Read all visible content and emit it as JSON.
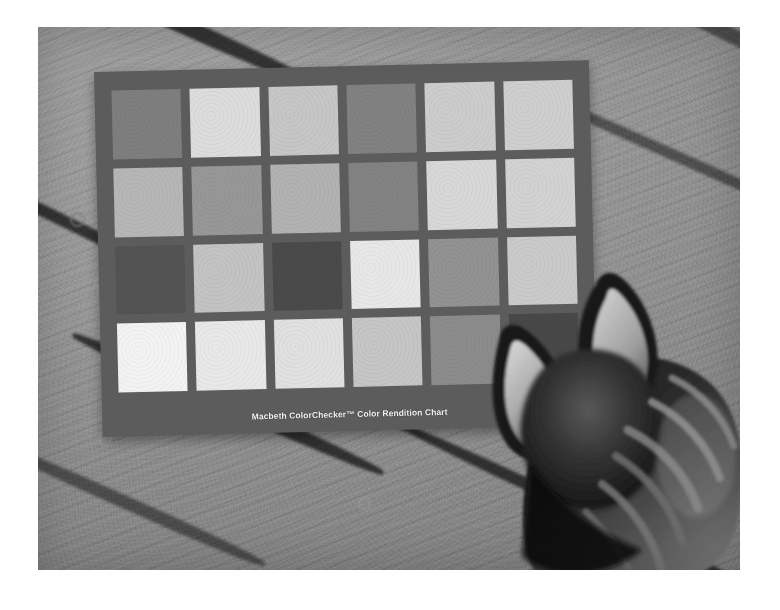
{
  "image": {
    "kind": "photograph",
    "subject": "Macbeth ColorChecker color rendition chart on a wooden deck with a cat",
    "rendering": "grayscale / black-and-white",
    "canvas": {
      "width": 780,
      "height": 610,
      "background": "#ffffff"
    },
    "photo_frame": {
      "left": 38,
      "top": 27,
      "width": 702,
      "height": 543
    }
  },
  "chart": {
    "caption": "Macbeth ColorChecker™ Color Rendition Chart",
    "frame_color": "#5d5d5d",
    "rows": 4,
    "columns": 6,
    "rotation_degrees": -1.35,
    "patches": [
      [
        {
          "name": "dark-skin",
          "gray": "#7e7e7e"
        },
        {
          "name": "light-skin",
          "gray": "#d8d8d8"
        },
        {
          "name": "blue-sky",
          "gray": "#c3c3c3"
        },
        {
          "name": "foliage",
          "gray": "#818181"
        },
        {
          "name": "blue-flower",
          "gray": "#c9c9c9"
        },
        {
          "name": "bluish-green",
          "gray": "#cbcbcb"
        }
      ],
      [
        {
          "name": "orange",
          "gray": "#b4b4b4"
        },
        {
          "name": "purplish-blue",
          "gray": "#969696"
        },
        {
          "name": "moderate-red",
          "gray": "#b0b0b0"
        },
        {
          "name": "purple",
          "gray": "#828282"
        },
        {
          "name": "yellow-green",
          "gray": "#d4d4d4"
        },
        {
          "name": "orange-yellow",
          "gray": "#cfcfcf"
        }
      ],
      [
        {
          "name": "blue",
          "gray": "#555555"
        },
        {
          "name": "green",
          "gray": "#c0c0c0"
        },
        {
          "name": "red",
          "gray": "#4c4c4c"
        },
        {
          "name": "yellow",
          "gray": "#e3e3e3"
        },
        {
          "name": "magenta",
          "gray": "#919191"
        },
        {
          "name": "cyan",
          "gray": "#c6c6c6"
        }
      ],
      [
        {
          "name": "white-9-5",
          "gray": "#eeeeee"
        },
        {
          "name": "neutral-8",
          "gray": "#e4e4e4"
        },
        {
          "name": "neutral-6-5",
          "gray": "#dcdcdc"
        },
        {
          "name": "neutral-5",
          "gray": "#c2c2c2"
        },
        {
          "name": "neutral-3-5",
          "gray": "#8b8b8b"
        },
        {
          "name": "black-2",
          "gray": "#4a4a4a"
        }
      ]
    ]
  },
  "scene": {
    "surface": "weathered wooden deck planks",
    "deck_tone": "#8d8d8d",
    "seam_color": "#1d1d1d",
    "seams": [
      {
        "left": -40,
        "top": -18,
        "width": 330,
        "height": 16,
        "rotate": 24
      },
      {
        "left": 430,
        "top": -30,
        "width": 400,
        "height": 15,
        "rotate": 26
      },
      {
        "left": -70,
        "top": 190,
        "width": 200,
        "height": 12,
        "rotate": 26
      },
      {
        "left": 480,
        "top": 120,
        "width": 300,
        "height": 11,
        "rotate": 24
      },
      {
        "left": 20,
        "top": 370,
        "width": 340,
        "height": 14,
        "rotate": 24
      },
      {
        "left": -60,
        "top": 470,
        "width": 300,
        "height": 13,
        "rotate": 24
      },
      {
        "left": 330,
        "top": 475,
        "width": 420,
        "height": 12,
        "rotate": 25
      }
    ],
    "knots": [
      {
        "left": 32,
        "top": 185,
        "size": 11,
        "tone": "#7a7a7a"
      },
      {
        "left": 56,
        "top": 250,
        "size": 9,
        "tone": "#a5a5a5"
      },
      {
        "left": 86,
        "top": 316,
        "size": 13,
        "tone": "#9c9c9c"
      },
      {
        "left": 130,
        "top": 420,
        "size": 17,
        "tone": "#8a8a8a"
      },
      {
        "left": 60,
        "top": 405,
        "size": 10,
        "tone": "#a0a0a0"
      },
      {
        "left": 320,
        "top": 470,
        "size": 9,
        "tone": "#989898"
      }
    ]
  },
  "cat": {
    "description": "tabby cat head seen from above-behind, facing the chart",
    "fur_dark": "#171717",
    "fur_mid": "#3c3c3c",
    "fur_light": "#b6b6b6",
    "ear_inner": "#cfcfcf",
    "parts": [
      "left-ear",
      "right-ear",
      "head",
      "neck",
      "back-stripes"
    ]
  },
  "colors": {
    "page_background": "#ffffff",
    "photo_background": "#8d8d8d",
    "chart_frame": "#5d5d5d",
    "caption_text": "#eeeeee"
  }
}
